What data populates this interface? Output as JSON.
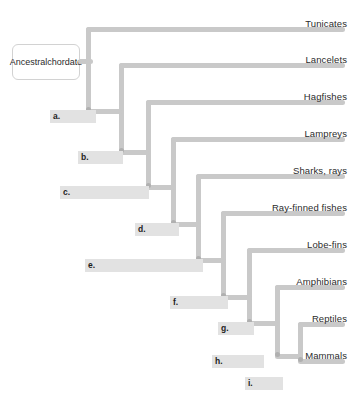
{
  "figure": {
    "type": "cladogram",
    "root_label": "Ancestral\nchordate",
    "root_label_line1": "Ancestral",
    "root_label_line2": "chordate",
    "line_color": "#c9c9c9",
    "blank_color": "#e2e2e2",
    "text_color": "#2b2b2b",
    "background": "#ffffff"
  },
  "taxa": [
    {
      "id": "tunicates",
      "label": "Tunicates",
      "y": 18
    },
    {
      "id": "lancelets",
      "label": "Lancelets",
      "y": 54
    },
    {
      "id": "hagfishes",
      "label": "Hagfishes",
      "y": 91
    },
    {
      "id": "lampreys",
      "label": "Lampreys",
      "y": 128
    },
    {
      "id": "sharks-rays",
      "label": "Sharks, rays",
      "y": 165
    },
    {
      "id": "ray-finned",
      "label": "Ray-finned fishes",
      "y": 202
    },
    {
      "id": "lobe-fins",
      "label": "Lobe-fins",
      "y": 239
    },
    {
      "id": "amphibians",
      "label": "Amphibians",
      "y": 276
    },
    {
      "id": "reptiles",
      "label": "Reptiles",
      "y": 313
    },
    {
      "id": "mammals",
      "label": "Mammals",
      "y": 350
    }
  ],
  "blanks": [
    {
      "id": "a",
      "label": "a.",
      "x": 50,
      "y": 110,
      "width": 46
    },
    {
      "id": "b",
      "label": "b.",
      "x": 78,
      "y": 151,
      "width": 45
    },
    {
      "id": "c",
      "label": "c.",
      "x": 60,
      "y": 186,
      "width": 89
    },
    {
      "id": "d",
      "label": "d.",
      "x": 135,
      "y": 223,
      "width": 44
    },
    {
      "id": "e",
      "label": "e.",
      "x": 85,
      "y": 259,
      "width": 118
    },
    {
      "id": "f",
      "label": "f.",
      "x": 170,
      "y": 296,
      "width": 58
    },
    {
      "id": "g",
      "label": "g.",
      "x": 218,
      "y": 322,
      "width": 36
    },
    {
      "id": "h",
      "label": "h.",
      "x": 212,
      "y": 355,
      "width": 52
    },
    {
      "id": "i",
      "label": "i.",
      "x": 245,
      "y": 377,
      "width": 38
    }
  ],
  "nodes": [
    {
      "id": "node-a",
      "x": 88,
      "y": 109
    },
    {
      "id": "node-b",
      "x": 121,
      "y": 150
    },
    {
      "id": "node-c",
      "x": 148,
      "y": 185
    },
    {
      "id": "node-d",
      "x": 173,
      "y": 222
    },
    {
      "id": "node-e",
      "x": 198,
      "y": 258
    },
    {
      "id": "node-f",
      "x": 223,
      "y": 295
    },
    {
      "id": "node-g",
      "x": 249,
      "y": 321
    },
    {
      "id": "node-h",
      "x": 263,
      "y": 354
    }
  ]
}
